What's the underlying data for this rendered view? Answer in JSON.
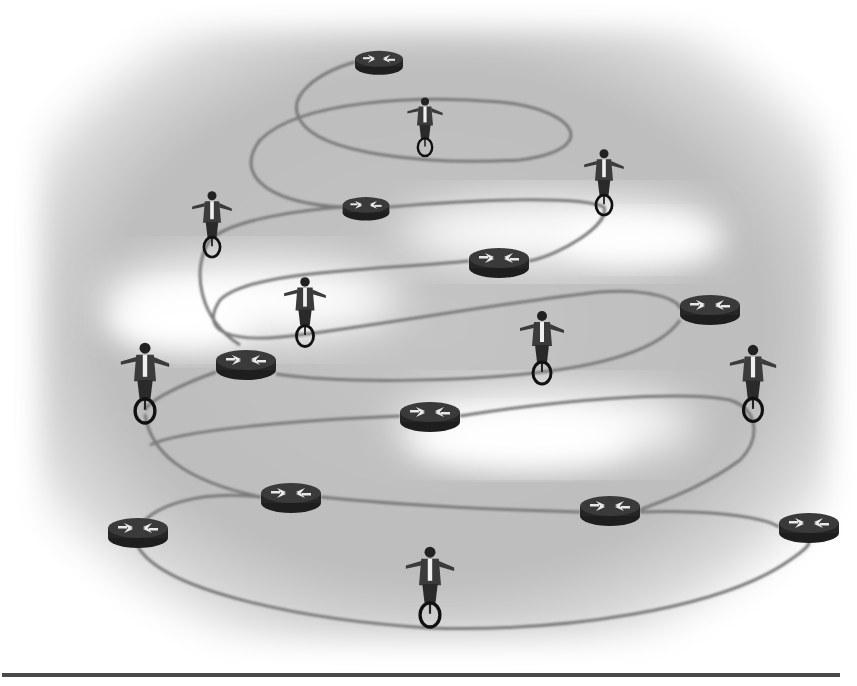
{
  "illustration": {
    "description": "Spiral network cable linking routers with businessmen balancing on unicycles",
    "colors": {
      "background": "#ffffff",
      "vignette": "#b9b9b9",
      "cloud": "#ffffff",
      "cable": "#7a7a7a",
      "router_body": "#2b2b2b",
      "router_arrows": "#e6e6e6",
      "figure": "#2f2f2f",
      "rule": "#4a4a4a"
    },
    "routers": [
      {
        "id": "r1",
        "x": 355,
        "y": 62,
        "w": 48,
        "h": 22
      },
      {
        "id": "r2",
        "x": 343,
        "y": 207,
        "w": 46,
        "h": 22
      },
      {
        "id": "r3",
        "x": 469,
        "y": 261,
        "w": 60,
        "h": 28
      },
      {
        "id": "r4",
        "x": 680,
        "y": 309,
        "w": 60,
        "h": 28
      },
      {
        "id": "r5",
        "x": 216,
        "y": 364,
        "w": 60,
        "h": 28
      },
      {
        "id": "r6",
        "x": 400,
        "y": 416,
        "w": 60,
        "h": 28
      },
      {
        "id": "r7",
        "x": 261,
        "y": 497,
        "w": 60,
        "h": 28
      },
      {
        "id": "r8",
        "x": 580,
        "y": 510,
        "w": 60,
        "h": 28
      },
      {
        "id": "r9",
        "x": 107,
        "y": 531,
        "w": 62,
        "h": 28
      },
      {
        "id": "r10",
        "x": 779,
        "y": 527,
        "w": 60,
        "h": 28
      }
    ],
    "riders": [
      {
        "id": "u1",
        "x": 425,
        "y": 150,
        "scale": 0.75
      },
      {
        "id": "u2",
        "x": 604,
        "y": 207,
        "scale": 0.85
      },
      {
        "id": "u3",
        "x": 212,
        "y": 250,
        "scale": 0.85
      },
      {
        "id": "u4",
        "x": 305,
        "y": 340,
        "scale": 0.9
      },
      {
        "id": "u5",
        "x": 542,
        "y": 378,
        "scale": 0.95
      },
      {
        "id": "u6",
        "x": 145,
        "y": 414,
        "scale": 1.05
      },
      {
        "id": "u7",
        "x": 753,
        "y": 414,
        "scale": 1.0
      },
      {
        "id": "u8",
        "x": 430,
        "y": 617,
        "scale": 1.05
      }
    ],
    "footer_rule": true
  }
}
